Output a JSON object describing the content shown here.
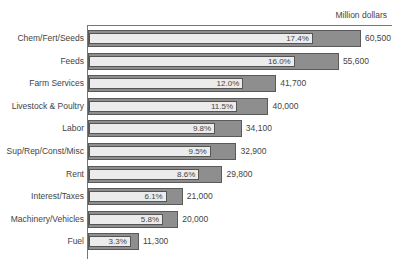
{
  "chart_data": {
    "type": "bar",
    "orientation": "horizontal",
    "title": "",
    "unit_label": "Million dollars",
    "xlabel": "",
    "ylabel": "",
    "categories": [
      "Chem/Fert/Seeds",
      "Feeds",
      "Farm Services",
      "Livestock & Poultry",
      "Labor",
      "Sup/Rep/Const/Misc",
      "Rent",
      "Interest/Taxes",
      "Machinery/Vehicles",
      "Fuel"
    ],
    "values": [
      60500,
      55600,
      41700,
      40000,
      34100,
      32900,
      29800,
      21000,
      20000,
      11300
    ],
    "value_labels": [
      "60,500",
      "55,600",
      "41,700",
      "40,000",
      "34,100",
      "32,900",
      "29,800",
      "21,000",
      "20,000",
      "11,300"
    ],
    "percent_values": [
      17.4,
      16.0,
      12.0,
      11.5,
      9.8,
      9.5,
      8.6,
      6.1,
      5.8,
      3.3
    ],
    "percent_labels": [
      "17.4%",
      "16.0%",
      "12.0%",
      "11.5%",
      "9.8%",
      "9.5%",
      "8.6%",
      "6.1%",
      "5.8%",
      "3.3%"
    ],
    "grid": false,
    "xlim": [
      0,
      62000
    ]
  },
  "colors": {
    "bar_outer": "#8e8e8e",
    "bar_inner": "#ececec",
    "border": "#5a5a5a"
  }
}
